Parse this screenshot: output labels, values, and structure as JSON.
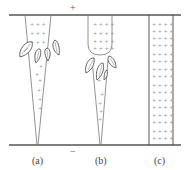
{
  "diagram": {
    "top_electrode_sign": "+",
    "bottom_electrode_sign": "−",
    "panels": [
      {
        "id": "a",
        "label": "(a)",
        "description": "tapered channel with leaf-shaped branches midway"
      },
      {
        "id": "b",
        "label": "(b)",
        "description": "rounded-bottom column with branches at tip, tapered channel below"
      },
      {
        "id": "c",
        "label": "(c)",
        "description": "fully bridged parallel channel filled with charges"
      }
    ],
    "charge_glyph": "+",
    "colors": {
      "line": "#555555",
      "charge": "#888888",
      "background": "#ffffff"
    }
  }
}
